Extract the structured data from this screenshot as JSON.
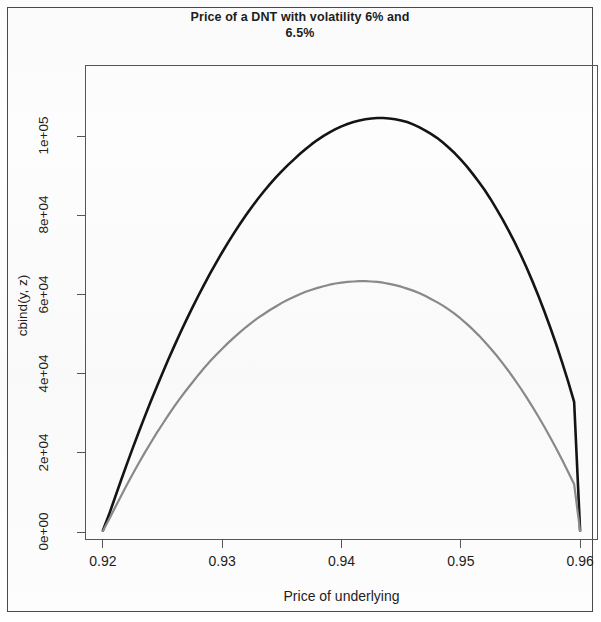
{
  "chart_data": {
    "type": "line",
    "title": "Price of a DNT with volatility 6% and 6.5%",
    "title_line1": "Price of a DNT with volatility 6% and",
    "title_line2": "6.5%",
    "xlabel": "Price of underlying",
    "ylabel": "cbind(y, z)",
    "xlim": [
      0.9185,
      0.9615
    ],
    "ylim": [
      -2000,
      118000
    ],
    "grid": false,
    "legend": null,
    "xticks": [
      0.92,
      0.93,
      0.94,
      0.95,
      0.96
    ],
    "xtick_labels": [
      "0.92",
      "0.93",
      "0.94",
      "0.95",
      "0.96"
    ],
    "yticks": [
      0,
      20000,
      40000,
      60000,
      80000,
      100000
    ],
    "ytick_labels": [
      "0e+00",
      "2e+04",
      "4e+04",
      "6e+04",
      "8e+04",
      "1e+05"
    ],
    "x": [
      0.92,
      0.9205,
      0.921,
      0.9215,
      0.922,
      0.9225,
      0.923,
      0.9235,
      0.924,
      0.9245,
      0.925,
      0.9255,
      0.926,
      0.9265,
      0.927,
      0.9275,
      0.928,
      0.9285,
      0.929,
      0.9295,
      0.93,
      0.9305,
      0.931,
      0.9315,
      0.932,
      0.9325,
      0.933,
      0.9335,
      0.934,
      0.9345,
      0.935,
      0.9355,
      0.936,
      0.9365,
      0.937,
      0.9375,
      0.938,
      0.9385,
      0.939,
      0.9395,
      0.94,
      0.9405,
      0.941,
      0.9415,
      0.942,
      0.9425,
      0.943,
      0.9435,
      0.944,
      0.9445,
      0.945,
      0.9455,
      0.946,
      0.9465,
      0.947,
      0.9475,
      0.948,
      0.9485,
      0.949,
      0.9495,
      0.95,
      0.9505,
      0.951,
      0.9515,
      0.952,
      0.9525,
      0.953,
      0.9535,
      0.954,
      0.9545,
      0.955,
      0.9555,
      0.956,
      0.9565,
      0.957,
      0.9575,
      0.958,
      0.9585,
      0.959,
      0.9595,
      0.96
    ],
    "series": [
      {
        "name": "volatility 6%",
        "color": "#141414",
        "width": 2.6,
        "peak_x": 0.9411,
        "peak_y": 107800,
        "values": [
          400,
          4300,
          8600,
          12900,
          17100,
          21200,
          25200,
          29100,
          32900,
          36600,
          40200,
          43700,
          47100,
          50400,
          53600,
          56700,
          59700,
          62600,
          65400,
          68100,
          70700,
          73200,
          75600,
          77900,
          80100,
          82200,
          84200,
          86100,
          87900,
          89600,
          91200,
          92700,
          94100,
          95500,
          96800,
          98000,
          99100,
          100100,
          101000,
          101800,
          102500,
          103100,
          103600,
          104000,
          104300,
          104500,
          104600,
          104600,
          104500,
          104300,
          104000,
          103600,
          103000,
          102300,
          101500,
          100600,
          99600,
          98400,
          97100,
          95700,
          94100,
          92400,
          90500,
          88500,
          86400,
          84100,
          81600,
          79000,
          76200,
          73300,
          70200,
          66900,
          63400,
          59700,
          55800,
          51700,
          47400,
          42800,
          38000,
          32900,
          400
        ]
      },
      {
        "name": "volatility 6.5%",
        "color": "#8a8a8a",
        "width": 2.2,
        "peak_x": 0.9409,
        "peak_y": 70900,
        "values": [
          300,
          3100,
          6100,
          9000,
          11900,
          14700,
          17400,
          20000,
          22500,
          25000,
          27300,
          29600,
          31800,
          33900,
          35900,
          37800,
          39700,
          41500,
          43200,
          44800,
          46300,
          47800,
          49200,
          50500,
          51800,
          53000,
          54100,
          55100,
          56100,
          57000,
          57900,
          58700,
          59400,
          60100,
          60700,
          61200,
          61700,
          62100,
          62500,
          62800,
          63000,
          63200,
          63300,
          63400,
          63400,
          63300,
          63200,
          63000,
          62700,
          62400,
          62000,
          61500,
          61000,
          60400,
          59700,
          58900,
          58100,
          57200,
          56200,
          55100,
          53900,
          52600,
          51200,
          49700,
          48100,
          46400,
          44600,
          42700,
          40700,
          38600,
          36400,
          34100,
          31700,
          29200,
          26600,
          23900,
          21100,
          18200,
          15200,
          12100,
          300
        ]
      }
    ]
  },
  "frame": {
    "border_color": "#4a4a4a",
    "axis_color": "#555555",
    "text_color": "#1d1d1d"
  }
}
